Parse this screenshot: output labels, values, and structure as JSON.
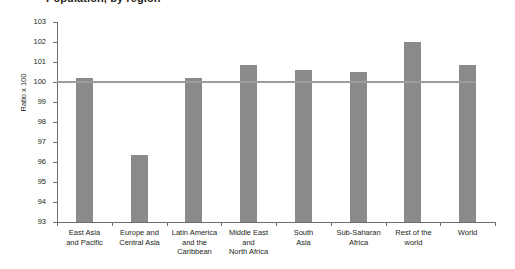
{
  "chart_data": {
    "type": "bar",
    "title": "Population, by region",
    "xlabel": "",
    "ylabel": "Ratio x 100",
    "ylim": [
      93,
      103
    ],
    "ytick_step": 1,
    "yticks": [
      103,
      102,
      101,
      100,
      99,
      98,
      97,
      96,
      95,
      94,
      93
    ],
    "grid": false,
    "legend": null,
    "bar_color": "#8a8a8a",
    "axis_color": "#6d6e71",
    "reference_line": {
      "value": 100,
      "color": "#9d9d9d",
      "label": ""
    },
    "categories": [
      "East Asia and Pacific",
      "Europe and Central Asia",
      "Latin America and the Caribbean",
      "Middle East and North Africa",
      "South Asia",
      "Sub-Saharan Africa",
      "Rest of the world",
      "World"
    ],
    "category_lines": [
      [
        "East Asia",
        "and Pacific"
      ],
      [
        "Europe and",
        "Central Asia"
      ],
      [
        "Latin America",
        "and the",
        "Caribbean"
      ],
      [
        "Middle East",
        "and",
        "North Africa"
      ],
      [
        "South",
        "Asia"
      ],
      [
        "Sub-Saharan",
        "Africa"
      ],
      [
        "Rest of the",
        "world"
      ],
      [
        "World"
      ]
    ],
    "values": [
      100.2,
      96.35,
      100.2,
      100.85,
      100.6,
      100.5,
      102.0,
      100.85
    ]
  }
}
